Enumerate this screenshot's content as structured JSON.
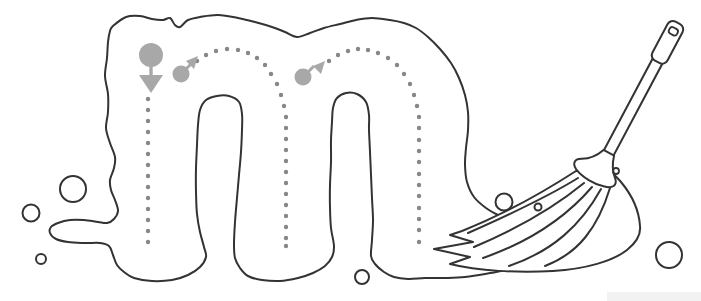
{
  "worksheet": {
    "kind": "letter-tracing-worksheet",
    "letter": "m",
    "theme": "mop",
    "colors": {
      "background": "#ffffff",
      "outline": "#333333",
      "guide_dots": "#878787",
      "indicators": "#a8a8a8",
      "watermark_strip": "#f2f2f2"
    },
    "tracing": {
      "dot_radius": 2.2,
      "strokes": [
        {
          "name": "stroke-1-left-down",
          "dots": [
            [
              148,
              99
            ],
            [
              148,
              110
            ],
            [
              148,
              121
            ],
            [
              148,
              132
            ],
            [
              148,
              143
            ],
            [
              148,
              154
            ],
            [
              148,
              165
            ],
            [
              148,
              176
            ],
            [
              148,
              187
            ],
            [
              148,
              198
            ],
            [
              148,
              209
            ],
            [
              148,
              220
            ],
            [
              148,
              231
            ],
            [
              148,
              242
            ]
          ]
        },
        {
          "name": "stroke-2-first-hump",
          "dots": [
            [
              197,
              61
            ],
            [
              206,
              55
            ],
            [
              216,
              51
            ],
            [
              227,
              49
            ],
            [
              238,
              50
            ],
            [
              248,
              53
            ],
            [
              257,
              58
            ],
            [
              265,
              65
            ],
            [
              271,
              74
            ],
            [
              277,
              84
            ],
            [
              281,
              95
            ],
            [
              284,
              106
            ],
            [
              286,
              117
            ],
            [
              286,
              128
            ],
            [
              286,
              139
            ],
            [
              286,
              150
            ],
            [
              286,
              161
            ],
            [
              286,
              172
            ],
            [
              286,
              183
            ],
            [
              286,
              194
            ],
            [
              286,
              205
            ],
            [
              286,
              216
            ],
            [
              286,
              227
            ],
            [
              286,
              238
            ],
            [
              286,
              246
            ]
          ]
        },
        {
          "name": "stroke-3-second-hump",
          "dots": [
            [
              329,
              61
            ],
            [
              338,
              55
            ],
            [
              348,
              51
            ],
            [
              358,
              49
            ],
            [
              368,
              50
            ],
            [
              378,
              53
            ],
            [
              388,
              58
            ],
            [
              397,
              65
            ],
            [
              404,
              74
            ],
            [
              410,
              84
            ],
            [
              414,
              95
            ],
            [
              417,
              106
            ],
            [
              419,
              117
            ],
            [
              419,
              128
            ],
            [
              419,
              140
            ],
            [
              419,
              151
            ],
            [
              419,
              162
            ],
            [
              419,
              174
            ],
            [
              419,
              185
            ],
            [
              419,
              196
            ],
            [
              419,
              208
            ],
            [
              419,
              219
            ],
            [
              419,
              230
            ],
            [
              419,
              242
            ]
          ]
        }
      ],
      "indicators": [
        {
          "kind": "start-circle-down-arrow",
          "cx": 151,
          "cy": 55,
          "r": 12,
          "stem": [
            151,
            64,
            151,
            77
          ],
          "head": [
            [
              139,
              75
            ],
            [
              163,
              75
            ],
            [
              151,
              93
            ]
          ]
        },
        {
          "kind": "direction-circle-up-right-arrow",
          "cx": 181,
          "cy": 74,
          "r": 8.5,
          "shaft": [
            186,
            69,
            192,
            63
          ],
          "head": [
            [
              198,
              56
            ],
            [
              186,
              61
            ],
            [
              194,
              69
            ]
          ]
        },
        {
          "kind": "direction-circle-up-right-arrow",
          "cx": 303,
          "cy": 77,
          "r": 8.5,
          "shaft": [
            308,
            72,
            314,
            66
          ],
          "head": [
            [
              325,
              61
            ],
            [
              313,
              66
            ],
            [
              321,
              74
            ]
          ]
        }
      ]
    },
    "bubbles": [
      {
        "cx": 73,
        "cy": 189,
        "r": 13
      },
      {
        "cx": 31,
        "cy": 213,
        "r": 8.5
      },
      {
        "cx": 41,
        "cy": 259,
        "r": 5
      },
      {
        "cx": 362,
        "cy": 277,
        "r": 7
      },
      {
        "cx": 669,
        "cy": 255,
        "r": 13
      },
      {
        "cx": 504,
        "cy": 202,
        "r": 8.5
      },
      {
        "cx": 538,
        "cy": 207,
        "r": 3.5
      }
    ],
    "shapes": {
      "blob_outline": [
        [
          113,
          26
        ],
        [
          126,
          17
        ],
        [
          140,
          16
        ],
        [
          152,
          19
        ],
        [
          163,
          20
        ],
        [
          170,
          18
        ],
        [
          175,
          25
        ],
        [
          180,
          27
        ],
        [
          188,
          20
        ],
        [
          200,
          17
        ],
        [
          218,
          15
        ],
        [
          238,
          18
        ],
        [
          255,
          22
        ],
        [
          272,
          27
        ],
        [
          285,
          32
        ],
        [
          297,
          37
        ],
        [
          310,
          33
        ],
        [
          324,
          28
        ],
        [
          340,
          24
        ],
        [
          356,
          20
        ],
        [
          372,
          18
        ],
        [
          390,
          20
        ],
        [
          404,
          23
        ],
        [
          416,
          28
        ],
        [
          428,
          37
        ],
        [
          440,
          49
        ],
        [
          451,
          63
        ],
        [
          459,
          78
        ],
        [
          465,
          95
        ],
        [
          468,
          112
        ],
        [
          468,
          130
        ],
        [
          466,
          148
        ],
        [
          465,
          165
        ],
        [
          467,
          182
        ],
        [
          474,
          197
        ],
        [
          486,
          208
        ],
        [
          500,
          216
        ],
        [
          513,
          222
        ],
        [
          524,
          231
        ],
        [
          530,
          243
        ],
        [
          531,
          255
        ],
        [
          522,
          264
        ],
        [
          505,
          270
        ],
        [
          485,
          274
        ],
        [
          465,
          277
        ],
        [
          445,
          278
        ],
        [
          425,
          278
        ],
        [
          408,
          279
        ],
        [
          394,
          277
        ],
        [
          384,
          272
        ],
        [
          375,
          264
        ],
        [
          371,
          256
        ],
        [
          372,
          240
        ],
        [
          373,
          220
        ],
        [
          372,
          198
        ],
        [
          371,
          175
        ],
        [
          370,
          152
        ],
        [
          369,
          130
        ],
        [
          369,
          115
        ],
        [
          366,
          102
        ],
        [
          357,
          94
        ],
        [
          346,
          93
        ],
        [
          337,
          98
        ],
        [
          333,
          108
        ],
        [
          332,
          122
        ],
        [
          331,
          140
        ],
        [
          331,
          162
        ],
        [
          330,
          185
        ],
        [
          330,
          208
        ],
        [
          331,
          228
        ],
        [
          334,
          246
        ],
        [
          332,
          257
        ],
        [
          325,
          266
        ],
        [
          313,
          273
        ],
        [
          298,
          278
        ],
        [
          280,
          281
        ],
        [
          262,
          280
        ],
        [
          248,
          276
        ],
        [
          240,
          268
        ],
        [
          235,
          258
        ],
        [
          234,
          244
        ],
        [
          235,
          222
        ],
        [
          237,
          198
        ],
        [
          239,
          175
        ],
        [
          241,
          152
        ],
        [
          242,
          130
        ],
        [
          242,
          114
        ],
        [
          239,
          102
        ],
        [
          229,
          96
        ],
        [
          217,
          96
        ],
        [
          206,
          100
        ],
        [
          200,
          110
        ],
        [
          198,
          125
        ],
        [
          197,
          145
        ],
        [
          196,
          168
        ],
        [
          196,
          192
        ],
        [
          197,
          214
        ],
        [
          200,
          232
        ],
        [
          204,
          247
        ],
        [
          206,
          257
        ],
        [
          200,
          267
        ],
        [
          188,
          275
        ],
        [
          172,
          280
        ],
        [
          152,
          281
        ],
        [
          134,
          278
        ],
        [
          124,
          272
        ],
        [
          117,
          265
        ],
        [
          113,
          255
        ],
        [
          109,
          246
        ],
        [
          100,
          243
        ],
        [
          85,
          243
        ],
        [
          68,
          242
        ],
        [
          56,
          239
        ],
        [
          50,
          233
        ],
        [
          51,
          227
        ],
        [
          58,
          223
        ],
        [
          70,
          220
        ],
        [
          84,
          220
        ],
        [
          98,
          222
        ],
        [
          107,
          223
        ],
        [
          114,
          219
        ],
        [
          118,
          211
        ],
        [
          115,
          200
        ],
        [
          111,
          190
        ],
        [
          110,
          180
        ],
        [
          114,
          168
        ],
        [
          115,
          157
        ],
        [
          110,
          143
        ],
        [
          106,
          128
        ],
        [
          108,
          112
        ],
        [
          108,
          94
        ],
        [
          105,
          76
        ],
        [
          107,
          58
        ],
        [
          108,
          42
        ],
        [
          110,
          31
        ]
      ]
    },
    "watermark": {
      "x": 607,
      "y": 292,
      "width": 94,
      "height": 9
    }
  }
}
